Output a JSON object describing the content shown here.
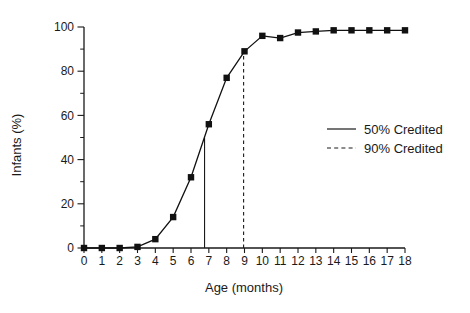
{
  "chart_data": {
    "type": "line",
    "title": "",
    "xlabel": "Age (months)",
    "ylabel": "Infants (%)",
    "xlim": [
      0,
      18
    ],
    "ylim": [
      0,
      100
    ],
    "grid": false,
    "x_ticks": [
      0,
      1,
      2,
      3,
      4,
      5,
      6,
      7,
      8,
      9,
      10,
      11,
      12,
      13,
      14,
      15,
      16,
      17,
      18
    ],
    "y_ticks_major": [
      0,
      20,
      40,
      60,
      80,
      100
    ],
    "y_ticks_minor": [
      10,
      30,
      50,
      70,
      90
    ],
    "series": [
      {
        "marker": "square",
        "color": "#111111",
        "x": [
          0,
          1,
          2,
          3,
          4,
          5,
          6,
          7,
          8,
          9,
          10,
          11,
          12,
          13,
          14,
          15,
          16,
          17,
          18
        ],
        "values": [
          0,
          0,
          0,
          0.5,
          4,
          14,
          32,
          56,
          77,
          89,
          96,
          95,
          97.5,
          98,
          98.5,
          98.5,
          98.5,
          98.5,
          98.5
        ]
      }
    ],
    "reference_lines": [
      {
        "label": "50% Credited",
        "style": "solid",
        "x": 6.76,
        "y_top": 50
      },
      {
        "label": "90% Credited",
        "style": "dashed",
        "x": 8.95,
        "y_top": 89
      }
    ],
    "legend": {
      "position": "right-middle",
      "entries": [
        {
          "label": "50% Credited",
          "style": "solid"
        },
        {
          "label": "90% Credited",
          "style": "dashed"
        }
      ]
    }
  }
}
